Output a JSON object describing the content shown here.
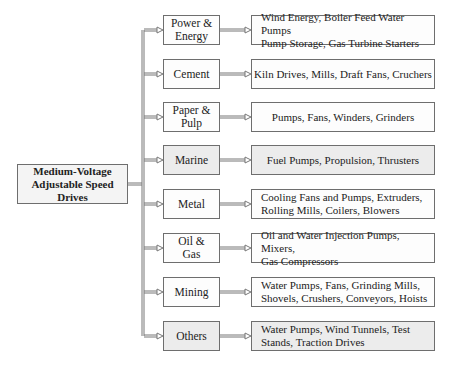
{
  "root": {
    "line1": "Medium-Voltage",
    "line2": "Adjustable Speed Drives"
  },
  "colors": {
    "border": "#6e6e6e",
    "shaded_fill": "#ececec",
    "white_fill": "#fdfdfd"
  },
  "categories": [
    {
      "label1": "Power &",
      "label2": "Energy",
      "detail1": "Wind Energy, Boiler Feed Water Pumps",
      "detail2": "Pump Storage, Gas Turbine Starters"
    },
    {
      "label1": "Cement",
      "label2": "",
      "detail1": "Kiln Drives, Mills, Draft Fans, Cruchers",
      "detail2": ""
    },
    {
      "label1": "Paper &",
      "label2": "Pulp",
      "detail1": "Pumps, Fans, Winders, Grinders",
      "detail2": ""
    },
    {
      "label1": "Marine",
      "label2": "",
      "detail1": "Fuel Pumps, Propulsion, Thrusters",
      "detail2": ""
    },
    {
      "label1": "Metal",
      "label2": "",
      "detail1": "Cooling Fans and Pumps, Extruders,",
      "detail2": "Rolling Mills, Coilers, Blowers"
    },
    {
      "label1": "Oil &",
      "label2": "Gas",
      "detail1": "Oil and Water Injection Pumps, Mixers,",
      "detail2": "Gas Compressors"
    },
    {
      "label1": "Mining",
      "label2": "",
      "detail1": "Water Pumps, Fans, Grinding Mills,",
      "detail2": "Shovels, Crushers, Conveyors, Hoists"
    },
    {
      "label1": "Others",
      "label2": "",
      "detail1": "Water Pumps, Wind Tunnels, Test",
      "detail2": "Stands, Traction Drives"
    }
  ]
}
